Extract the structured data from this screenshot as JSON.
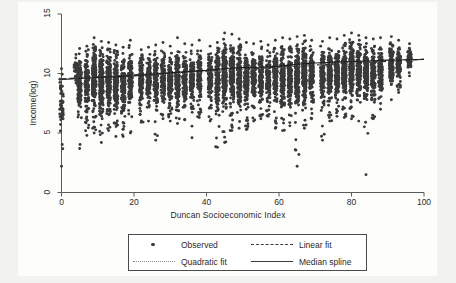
{
  "chart_data": {
    "type": "scatter",
    "title": "",
    "xlabel": "Duncan Socioeconomic Index",
    "ylabel": "Income(log)",
    "xlim": [
      0,
      100
    ],
    "ylim": [
      0,
      15
    ],
    "xticks": [
      0,
      20,
      40,
      60,
      80,
      100
    ],
    "yticks": [
      0,
      5,
      10,
      15
    ],
    "grid": false,
    "legend_position": "below-axes",
    "marker_color": "#3a3a3a",
    "series": [
      {
        "name": "Observed",
        "type": "scatter",
        "marker": "circle",
        "note": "Dense vertical columns of observations at discrete Duncan SEI values; bulk of points between log-income 6 and 13, with sparse low outliers down to ~1.5",
        "columns": [
          {
            "x": 0,
            "y_min": 2.2,
            "y_max": 10.4,
            "y_dense_low": 5.0,
            "y_dense_high": 10.3,
            "n": 46
          },
          {
            "x": 4,
            "y_min": 9.2,
            "y_max": 11.6,
            "y_dense_low": 9.4,
            "y_dense_high": 11.4,
            "n": 30
          },
          {
            "x": 5,
            "y_min": 3.7,
            "y_max": 12.1,
            "y_dense_low": 6.2,
            "y_dense_high": 11.8,
            "n": 120
          },
          {
            "x": 7,
            "y_min": 4.8,
            "y_max": 12.3,
            "y_dense_low": 6.3,
            "y_dense_high": 12.0,
            "n": 150
          },
          {
            "x": 9,
            "y_min": 5.0,
            "y_max": 13.0,
            "y_dense_low": 6.5,
            "y_dense_high": 12.5,
            "n": 190
          },
          {
            "x": 11,
            "y_min": 4.2,
            "y_max": 12.7,
            "y_dense_low": 6.2,
            "y_dense_high": 12.3,
            "n": 200
          },
          {
            "x": 13,
            "y_min": 5.2,
            "y_max": 12.6,
            "y_dense_low": 6.4,
            "y_dense_high": 12.2,
            "n": 180
          },
          {
            "x": 15,
            "y_min": 4.7,
            "y_max": 12.4,
            "y_dense_low": 6.0,
            "y_dense_high": 12.1,
            "n": 170
          },
          {
            "x": 17,
            "y_min": 4.7,
            "y_max": 12.2,
            "y_dense_low": 6.2,
            "y_dense_high": 11.9,
            "n": 150
          },
          {
            "x": 19,
            "y_min": 5.0,
            "y_max": 12.8,
            "y_dense_low": 6.5,
            "y_dense_high": 12.4,
            "n": 140
          },
          {
            "x": 22,
            "y_min": 5.9,
            "y_max": 12.0,
            "y_dense_low": 7.0,
            "y_dense_high": 11.7,
            "n": 130
          },
          {
            "x": 24,
            "y_min": 6.0,
            "y_max": 12.2,
            "y_dense_low": 7.2,
            "y_dense_high": 11.8,
            "n": 120
          },
          {
            "x": 26,
            "y_min": 4.4,
            "y_max": 12.4,
            "y_dense_low": 6.8,
            "y_dense_high": 12.0,
            "n": 140
          },
          {
            "x": 28,
            "y_min": 6.2,
            "y_max": 12.6,
            "y_dense_low": 7.2,
            "y_dense_high": 12.2,
            "n": 120
          },
          {
            "x": 30,
            "y_min": 6.0,
            "y_max": 12.3,
            "y_dense_low": 7.0,
            "y_dense_high": 11.9,
            "n": 130
          },
          {
            "x": 32,
            "y_min": 5.8,
            "y_max": 13.0,
            "y_dense_low": 7.0,
            "y_dense_high": 12.5,
            "n": 150
          },
          {
            "x": 34,
            "y_min": 6.1,
            "y_max": 12.5,
            "y_dense_low": 7.1,
            "y_dense_high": 12.1,
            "n": 130
          },
          {
            "x": 36,
            "y_min": 4.6,
            "y_max": 12.4,
            "y_dense_low": 6.6,
            "y_dense_high": 12.0,
            "n": 120
          },
          {
            "x": 38,
            "y_min": 6.3,
            "y_max": 12.8,
            "y_dense_low": 7.2,
            "y_dense_high": 12.4,
            "n": 110
          },
          {
            "x": 41,
            "y_min": 6.0,
            "y_max": 12.3,
            "y_dense_low": 7.0,
            "y_dense_high": 11.9,
            "n": 120
          },
          {
            "x": 43,
            "y_min": 3.8,
            "y_max": 12.6,
            "y_dense_low": 6.5,
            "y_dense_high": 12.2,
            "n": 160
          },
          {
            "x": 45,
            "y_min": 4.2,
            "y_max": 13.4,
            "y_dense_low": 6.8,
            "y_dense_high": 13.0,
            "n": 200
          },
          {
            "x": 47,
            "y_min": 5.2,
            "y_max": 13.3,
            "y_dense_low": 6.9,
            "y_dense_high": 12.9,
            "n": 190
          },
          {
            "x": 49,
            "y_min": 5.4,
            "y_max": 12.9,
            "y_dense_low": 6.9,
            "y_dense_high": 12.5,
            "n": 170
          },
          {
            "x": 51,
            "y_min": 5.3,
            "y_max": 12.6,
            "y_dense_low": 6.8,
            "y_dense_high": 12.2,
            "n": 150
          },
          {
            "x": 53,
            "y_min": 6.0,
            "y_max": 12.5,
            "y_dense_low": 7.1,
            "y_dense_high": 12.1,
            "n": 140
          },
          {
            "x": 55,
            "y_min": 6.2,
            "y_max": 12.7,
            "y_dense_low": 7.2,
            "y_dense_high": 12.3,
            "n": 140
          },
          {
            "x": 57,
            "y_min": 6.4,
            "y_max": 12.4,
            "y_dense_low": 7.3,
            "y_dense_high": 12.0,
            "n": 120
          },
          {
            "x": 59,
            "y_min": 5.4,
            "y_max": 12.8,
            "y_dense_low": 7.0,
            "y_dense_high": 12.4,
            "n": 150
          },
          {
            "x": 61,
            "y_min": 5.2,
            "y_max": 13.0,
            "y_dense_low": 6.8,
            "y_dense_high": 12.6,
            "n": 180
          },
          {
            "x": 63,
            "y_min": 5.6,
            "y_max": 12.9,
            "y_dense_low": 7.0,
            "y_dense_high": 12.5,
            "n": 170
          },
          {
            "x": 65,
            "y_min": 2.2,
            "y_max": 13.1,
            "y_dense_low": 7.0,
            "y_dense_high": 12.7,
            "n": 190
          },
          {
            "x": 67,
            "y_min": 5.4,
            "y_max": 13.2,
            "y_dense_low": 7.2,
            "y_dense_high": 12.8,
            "n": 180
          },
          {
            "x": 69,
            "y_min": 6.2,
            "y_max": 12.8,
            "y_dense_low": 7.4,
            "y_dense_high": 12.4,
            "n": 150
          },
          {
            "x": 72,
            "y_min": 4.4,
            "y_max": 12.7,
            "y_dense_low": 7.2,
            "y_dense_high": 12.3,
            "n": 140
          },
          {
            "x": 74,
            "y_min": 6.0,
            "y_max": 13.0,
            "y_dense_low": 7.4,
            "y_dense_high": 12.6,
            "n": 160
          },
          {
            "x": 76,
            "y_min": 6.4,
            "y_max": 12.9,
            "y_dense_low": 7.5,
            "y_dense_high": 12.5,
            "n": 150
          },
          {
            "x": 78,
            "y_min": 6.3,
            "y_max": 13.2,
            "y_dense_low": 7.5,
            "y_dense_high": 12.8,
            "n": 170
          },
          {
            "x": 80,
            "y_min": 6.2,
            "y_max": 13.4,
            "y_dense_low": 7.4,
            "y_dense_high": 13.0,
            "n": 180
          },
          {
            "x": 82,
            "y_min": 6.0,
            "y_max": 13.2,
            "y_dense_low": 7.4,
            "y_dense_high": 12.8,
            "n": 160
          },
          {
            "x": 84,
            "y_min": 1.5,
            "y_max": 13.0,
            "y_dense_low": 7.4,
            "y_dense_high": 12.6,
            "n": 150
          },
          {
            "x": 86,
            "y_min": 6.2,
            "y_max": 12.9,
            "y_dense_low": 7.6,
            "y_dense_high": 12.5,
            "n": 140
          },
          {
            "x": 88,
            "y_min": 7.0,
            "y_max": 13.0,
            "y_dense_low": 8.0,
            "y_dense_high": 12.6,
            "n": 120
          },
          {
            "x": 91,
            "y_min": 7.8,
            "y_max": 13.1,
            "y_dense_low": 8.6,
            "y_dense_high": 12.8,
            "n": 110
          },
          {
            "x": 93,
            "y_min": 8.4,
            "y_max": 12.8,
            "y_dense_low": 9.0,
            "y_dense_high": 12.5,
            "n": 90
          },
          {
            "x": 96,
            "y_min": 9.8,
            "y_max": 12.5,
            "y_dense_low": 10.2,
            "y_dense_high": 12.3,
            "n": 70
          }
        ]
      },
      {
        "name": "Linear fit",
        "type": "line",
        "style": "dashed",
        "x": [
          0,
          100
        ],
        "y": [
          9.55,
          11.2
        ]
      },
      {
        "name": "Quadratic fit",
        "type": "line",
        "style": "dotted",
        "x": [
          0,
          10,
          20,
          30,
          40,
          50,
          60,
          70,
          80,
          90,
          100
        ],
        "y": [
          9.5,
          9.64,
          9.8,
          9.97,
          10.15,
          10.34,
          10.54,
          10.74,
          10.93,
          11.09,
          11.2
        ]
      },
      {
        "name": "Median spline",
        "type": "line",
        "style": "solid",
        "x": [
          0,
          5,
          10,
          15,
          20,
          25,
          30,
          35,
          40,
          45,
          50,
          55,
          60,
          65,
          70,
          75,
          80,
          85,
          90,
          95,
          100
        ],
        "y": [
          9.5,
          9.58,
          9.66,
          9.72,
          9.8,
          9.92,
          10.05,
          10.16,
          10.26,
          10.42,
          10.5,
          10.52,
          10.62,
          10.78,
          10.88,
          10.95,
          11.0,
          11.05,
          11.12,
          11.16,
          11.18
        ]
      }
    ]
  },
  "axes": {
    "xlabel": "Duncan Socioeconomic Index",
    "ylabel": "Income(log)",
    "xticks": [
      "0",
      "20",
      "40",
      "60",
      "80",
      "100"
    ],
    "yticks": [
      "0",
      "5",
      "10",
      "15"
    ]
  },
  "legend": {
    "entries": [
      {
        "label": "Observed",
        "key": "marker-dot"
      },
      {
        "label": "Linear fit",
        "key": "line-dashed"
      },
      {
        "label": "Quadratic fit",
        "key": "line-dotted"
      },
      {
        "label": "Median spline",
        "key": "line-solid"
      }
    ]
  },
  "colors": {
    "marker": "#3a3a3a",
    "axis": "#4a4a4a",
    "text": "#2b2b2b",
    "canvas": "#fdfdfc",
    "page": "#f2f2f0"
  }
}
